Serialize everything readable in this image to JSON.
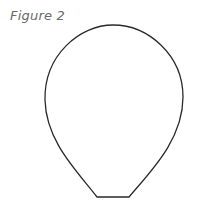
{
  "figure": {
    "caption": "Figure 2",
    "shape": "balloon-outline",
    "stroke_color": "#2a2a2a",
    "fill_color": "#ffffff"
  }
}
